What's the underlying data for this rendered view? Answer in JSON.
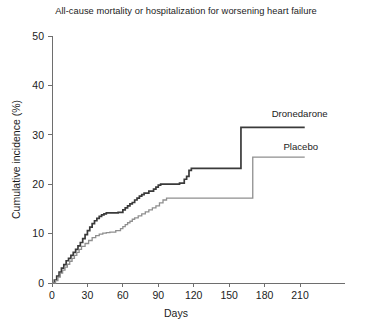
{
  "chart_data": {
    "type": "line",
    "title": "All-cause mortality or hospitalization for worsening heart failure",
    "xlabel": "Days",
    "ylabel": "Cumulative incidence (%)",
    "xlim": [
      0,
      220
    ],
    "ylim": [
      0,
      50
    ],
    "xticks": [
      0,
      30,
      60,
      90,
      120,
      150,
      180,
      210
    ],
    "yticks": [
      0,
      10,
      20,
      30,
      40,
      50
    ],
    "grid": false,
    "legend_position": "inline-right",
    "step_type": "post",
    "series": [
      {
        "name": "Dronedarone",
        "color": "#3a3a3a",
        "width": 1.7,
        "label_x": 186,
        "label_y": 33.6,
        "x": [
          0,
          2,
          4,
          6,
          8,
          10,
          12,
          14,
          16,
          18,
          20,
          22,
          24,
          26,
          28,
          30,
          32,
          34,
          36,
          38,
          40,
          42,
          44,
          46,
          56,
          60,
          62,
          64,
          66,
          68,
          70,
          72,
          74,
          76,
          78,
          82,
          86,
          88,
          90,
          92,
          108,
          112,
          114,
          116,
          118,
          160,
          214
        ],
        "y": [
          0,
          0.6,
          1.4,
          2.2,
          3.0,
          3.7,
          4.5,
          5.0,
          5.6,
          6.2,
          6.8,
          7.5,
          8.2,
          9.0,
          9.8,
          10.6,
          11.3,
          12.0,
          12.6,
          13.1,
          13.5,
          13.8,
          14.0,
          14.2,
          14.3,
          14.8,
          15.2,
          15.6,
          16.0,
          16.3,
          16.8,
          17.2,
          17.6,
          17.9,
          18.2,
          18.6,
          19.0,
          19.4,
          19.8,
          20.0,
          20.2,
          21.0,
          21.6,
          22.8,
          23.2,
          31.5,
          31.5
        ]
      },
      {
        "name": "Placebo",
        "color": "#8f8f8f",
        "width": 1.3,
        "label_x": 196,
        "label_y": 26.9,
        "x": [
          0,
          3,
          5,
          7,
          9,
          11,
          13,
          15,
          17,
          19,
          21,
          23,
          25,
          28,
          31,
          34,
          37,
          40,
          43,
          46,
          49,
          54,
          58,
          60,
          62,
          64,
          66,
          68,
          70,
          73,
          76,
          79,
          82,
          85,
          88,
          91,
          94,
          97,
          170,
          214
        ],
        "y": [
          0,
          0.5,
          1.2,
          2.0,
          2.6,
          3.2,
          3.8,
          4.4,
          5.0,
          5.6,
          6.2,
          6.8,
          7.4,
          8.0,
          8.6,
          9.2,
          9.6,
          9.9,
          10.1,
          10.2,
          10.3,
          10.6,
          11.0,
          11.4,
          11.8,
          12.2,
          12.5,
          12.9,
          13.2,
          13.6,
          14.0,
          14.4,
          14.8,
          15.2,
          15.6,
          16.2,
          16.8,
          17.2,
          25.5,
          25.5
        ]
      }
    ]
  }
}
